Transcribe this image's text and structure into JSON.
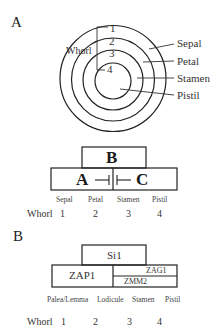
{
  "panel_a": {
    "letter": "A",
    "circle": {
      "whorl_label": "Whorl",
      "ring_numbers": [
        "1",
        "2",
        "3",
        "4"
      ],
      "organ_labels": [
        "Sepal",
        "Petal",
        "Stamen",
        "Pistil"
      ]
    },
    "abc_model": {
      "top_box": "B",
      "left_box": "A",
      "right_box": "C",
      "inhibition_left": "⊣",
      "inhibition_right": "⊢",
      "organ_labels": [
        "Sepal",
        "Petal",
        "Stamen",
        "Pistil"
      ],
      "whorl_label": "Whorl",
      "whorl_numbers": [
        "1",
        "2",
        "3",
        "4"
      ]
    }
  },
  "panel_b": {
    "letter": "B",
    "top_box": "Si1",
    "left_box": "ZAP1",
    "right_top": "ZAG1",
    "right_bottom": "ZMM2",
    "organ_labels": [
      "Palea/Lemma",
      "Lodicule",
      "Stamen",
      "Pistil"
    ],
    "whorl_label": "Whorl",
    "whorl_numbers": [
      "1",
      "2",
      "3",
      "4"
    ]
  }
}
